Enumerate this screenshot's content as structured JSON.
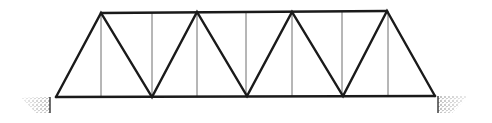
{
  "diagram": {
    "type": "warren-truss-bridge-with-verticals",
    "colors": {
      "members": "#1a1a1a",
      "verticals": "#6e6e6e",
      "abutment_fill": "#9a9a9a",
      "background": "#ffffff"
    },
    "top_chord": {
      "x1": 101,
      "y1": 13,
      "x2": 387,
      "y2": 11
    },
    "bottom_chord": {
      "x1": 56,
      "y1": 97,
      "x2": 435,
      "y2": 96
    },
    "top_nodes": [
      [
        101,
        13
      ],
      [
        197,
        12
      ],
      [
        292,
        12
      ],
      [
        387,
        11
      ]
    ],
    "bottom_nodes": [
      [
        56,
        97
      ],
      [
        152,
        97
      ],
      [
        247,
        96
      ],
      [
        343,
        96
      ],
      [
        435,
        96
      ]
    ],
    "verticals_x": [
      101,
      152,
      197,
      246,
      292,
      342,
      388
    ],
    "abutments": [
      {
        "side": "left",
        "x": 22,
        "y": 97,
        "w": 28,
        "h": 16
      },
      {
        "side": "right",
        "x": 438,
        "y": 96,
        "w": 30,
        "h": 17
      }
    ]
  }
}
